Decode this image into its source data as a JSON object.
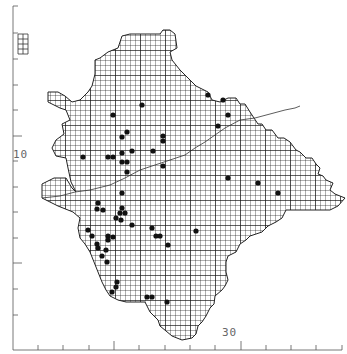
{
  "map": {
    "type": "grid-distribution-map",
    "grid_cell_px": 5,
    "major_grid_px": 25,
    "colors": {
      "background": "#ffffff",
      "grid": "#1a1a1a",
      "outline": "#222222",
      "dot": "#111111",
      "axis": "#555555"
    },
    "outline": [
      [
        95,
        60
      ],
      [
        100,
        58
      ],
      [
        108,
        52
      ],
      [
        118,
        48
      ],
      [
        122,
        36
      ],
      [
        130,
        34
      ],
      [
        160,
        34
      ],
      [
        163,
        30
      ],
      [
        170,
        30
      ],
      [
        175,
        34
      ],
      [
        177,
        48
      ],
      [
        170,
        52
      ],
      [
        172,
        60
      ],
      [
        180,
        70
      ],
      [
        188,
        78
      ],
      [
        196,
        86
      ],
      [
        208,
        92
      ],
      [
        212,
        100
      ],
      [
        220,
        102
      ],
      [
        228,
        98
      ],
      [
        236,
        98
      ],
      [
        240,
        104
      ],
      [
        245,
        104
      ],
      [
        250,
        112
      ],
      [
        258,
        124
      ],
      [
        262,
        124
      ],
      [
        266,
        130
      ],
      [
        272,
        130
      ],
      [
        278,
        138
      ],
      [
        284,
        138
      ],
      [
        290,
        142
      ],
      [
        296,
        150
      ],
      [
        300,
        152
      ],
      [
        306,
        158
      ],
      [
        312,
        158
      ],
      [
        316,
        164
      ],
      [
        320,
        168
      ],
      [
        318,
        174
      ],
      [
        323,
        176
      ],
      [
        326,
        180
      ],
      [
        333,
        183
      ],
      [
        330,
        190
      ],
      [
        335,
        194
      ],
      [
        340,
        196
      ],
      [
        345,
        198
      ],
      [
        338,
        206
      ],
      [
        330,
        210
      ],
      [
        318,
        210
      ],
      [
        300,
        210
      ],
      [
        286,
        210
      ],
      [
        282,
        218
      ],
      [
        276,
        222
      ],
      [
        268,
        226
      ],
      [
        262,
        232
      ],
      [
        250,
        236
      ],
      [
        246,
        240
      ],
      [
        240,
        244
      ],
      [
        236,
        252
      ],
      [
        228,
        256
      ],
      [
        226,
        262
      ],
      [
        226,
        272
      ],
      [
        228,
        280
      ],
      [
        225,
        286
      ],
      [
        222,
        290
      ],
      [
        215,
        296
      ],
      [
        214,
        304
      ],
      [
        210,
        308
      ],
      [
        206,
        316
      ],
      [
        202,
        322
      ],
      [
        198,
        326
      ],
      [
        196,
        334
      ],
      [
        192,
        338
      ],
      [
        182,
        340
      ],
      [
        172,
        336
      ],
      [
        160,
        326
      ],
      [
        158,
        320
      ],
      [
        150,
        312
      ],
      [
        145,
        302
      ],
      [
        136,
        302
      ],
      [
        126,
        302
      ],
      [
        118,
        300
      ],
      [
        110,
        296
      ],
      [
        106,
        290
      ],
      [
        102,
        282
      ],
      [
        98,
        272
      ],
      [
        94,
        262
      ],
      [
        90,
        252
      ],
      [
        85,
        244
      ],
      [
        80,
        238
      ],
      [
        78,
        228
      ],
      [
        80,
        218
      ],
      [
        73,
        212
      ],
      [
        58,
        206
      ],
      [
        42,
        198
      ],
      [
        42,
        184
      ],
      [
        54,
        178
      ],
      [
        66,
        178
      ],
      [
        72,
        188
      ],
      [
        76,
        192
      ],
      [
        71,
        182
      ],
      [
        68,
        168
      ],
      [
        66,
        158
      ],
      [
        56,
        156
      ],
      [
        52,
        148
      ],
      [
        56,
        140
      ],
      [
        64,
        134
      ],
      [
        62,
        124
      ],
      [
        70,
        120
      ],
      [
        66,
        110
      ],
      [
        60,
        108
      ],
      [
        48,
        102
      ],
      [
        48,
        92
      ],
      [
        58,
        92
      ],
      [
        65,
        96
      ],
      [
        72,
        102
      ],
      [
        80,
        100
      ],
      [
        88,
        92
      ],
      [
        92,
        86
      ],
      [
        95,
        74
      ]
    ],
    "inset_box": {
      "x": 18,
      "y": 34,
      "w": 10,
      "h": 20
    },
    "internal_boundary": [
      [
        42,
        198
      ],
      [
        60,
        196
      ],
      [
        75,
        192
      ],
      [
        90,
        190
      ],
      [
        110,
        185
      ],
      [
        125,
        178
      ],
      [
        140,
        170
      ],
      [
        155,
        165
      ],
      [
        170,
        160
      ],
      [
        185,
        155
      ],
      [
        195,
        148
      ],
      [
        205,
        142
      ],
      [
        215,
        135
      ],
      [
        225,
        128
      ],
      [
        240,
        120
      ],
      [
        255,
        118
      ],
      [
        270,
        114
      ],
      [
        285,
        110
      ],
      [
        295,
        108
      ],
      [
        300,
        106
      ]
    ],
    "dots": [
      [
        142,
        105
      ],
      [
        208,
        95
      ],
      [
        223,
        100
      ],
      [
        228,
        115
      ],
      [
        218,
        126
      ],
      [
        113,
        115
      ],
      [
        127,
        132
      ],
      [
        122,
        137
      ],
      [
        163,
        136
      ],
      [
        163,
        141
      ],
      [
        108,
        157
      ],
      [
        113,
        157
      ],
      [
        122,
        153
      ],
      [
        132,
        151
      ],
      [
        122,
        162
      ],
      [
        127,
        162
      ],
      [
        153,
        151
      ],
      [
        127,
        172
      ],
      [
        163,
        166
      ],
      [
        122,
        193
      ],
      [
        83,
        157
      ],
      [
        228,
        178
      ],
      [
        258,
        183
      ],
      [
        278,
        193
      ],
      [
        98,
        203
      ],
      [
        97,
        209
      ],
      [
        103,
        210
      ],
      [
        120,
        213
      ],
      [
        125,
        213
      ],
      [
        116,
        218
      ],
      [
        121,
        220
      ],
      [
        132,
        225
      ],
      [
        88,
        230
      ],
      [
        92,
        236
      ],
      [
        108,
        236
      ],
      [
        113,
        237
      ],
      [
        108,
        240
      ],
      [
        97,
        244
      ],
      [
        98,
        248
      ],
      [
        106,
        250
      ],
      [
        102,
        256
      ],
      [
        107,
        262
      ],
      [
        152,
        228
      ],
      [
        156,
        236
      ],
      [
        160,
        236
      ],
      [
        122,
        208
      ],
      [
        168,
        245
      ],
      [
        196,
        231
      ],
      [
        117,
        282
      ],
      [
        116,
        287
      ],
      [
        112,
        292
      ],
      [
        147,
        297
      ],
      [
        152,
        297
      ],
      [
        167,
        302
      ]
    ]
  },
  "axes": {
    "left": {
      "x": 13,
      "y_top": 6,
      "y_bottom": 350,
      "ticks": [
        6,
        33,
        59,
        85,
        110,
        136,
        161,
        187,
        212,
        238,
        263,
        289,
        315
      ],
      "major_ticks": [
        136,
        263
      ]
    },
    "bottom": {
      "y": 350,
      "x_left": 13,
      "x_right": 342,
      "ticks": [
        38,
        63,
        89,
        114,
        139,
        165,
        190,
        215,
        241,
        266,
        291,
        316,
        342
      ],
      "major_ticks": [
        114,
        241
      ]
    },
    "labels": {
      "left_label": "10",
      "bottom_label": "30"
    }
  }
}
